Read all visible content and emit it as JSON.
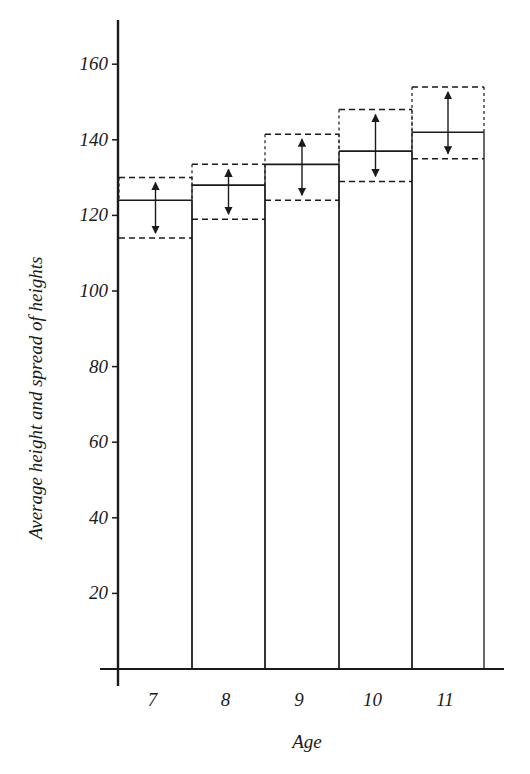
{
  "chart_data": {
    "type": "bar",
    "title": "",
    "xlabel": "Age",
    "ylabel": "Average height and spread of heights",
    "categories": [
      "7",
      "8",
      "9",
      "10",
      "11"
    ],
    "series": [
      {
        "name": "Average height",
        "values": [
          124,
          128,
          133.5,
          137,
          142
        ]
      },
      {
        "name": "Spread upper",
        "values": [
          130,
          133.5,
          141.5,
          148,
          154
        ]
      },
      {
        "name": "Spread lower",
        "values": [
          114,
          119,
          124,
          129,
          135
        ]
      }
    ],
    "yticks": [
      20,
      40,
      60,
      80,
      100,
      120,
      140,
      160
    ],
    "ylim": [
      0,
      170
    ],
    "grid": false,
    "legend": "none"
  },
  "colors": {
    "ink": "#1a1a1a",
    "background": "#ffffff"
  }
}
